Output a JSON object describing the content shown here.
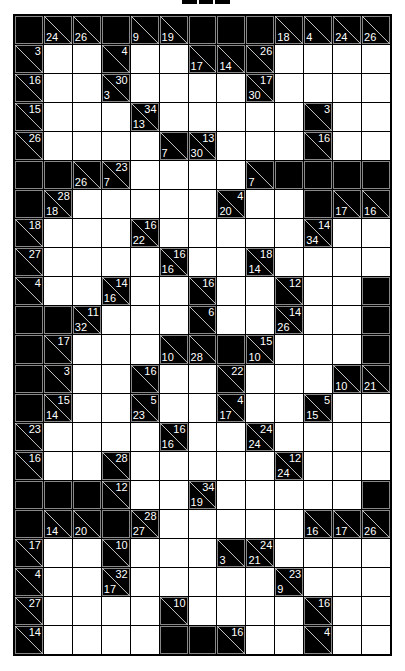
{
  "puzzle": {
    "type": "kakuro",
    "rows": 22,
    "cols": 13,
    "legend": "B = black block; W = white entry cell; [down, across] = clue cell (null = no clue)",
    "grid": [
      [
        "B",
        [
          24,
          null
        ],
        [
          26,
          null
        ],
        "B",
        [
          9,
          null
        ],
        [
          19,
          null
        ],
        "B",
        "B",
        "B",
        [
          18,
          null
        ],
        [
          4,
          null
        ],
        [
          24,
          null
        ],
        [
          26,
          null
        ]
      ],
      [
        [
          null,
          3
        ],
        "W",
        "W",
        [
          null,
          4
        ],
        "W",
        "W",
        [
          17,
          null
        ],
        [
          14,
          null
        ],
        [
          null,
          26
        ],
        "W",
        "W",
        "W",
        "W"
      ],
      [
        [
          null,
          16
        ],
        "W",
        "W",
        [
          3,
          30
        ],
        "W",
        "W",
        "W",
        "W",
        [
          30,
          17
        ],
        "W",
        "W",
        "W",
        "W"
      ],
      [
        [
          null,
          15
        ],
        "W",
        "W",
        "W",
        [
          13,
          34
        ],
        "W",
        "W",
        "W",
        "W",
        "W",
        [
          null,
          3
        ],
        "W",
        "W"
      ],
      [
        [
          null,
          26
        ],
        "W",
        "W",
        "W",
        "W",
        [
          7,
          null
        ],
        [
          30,
          13
        ],
        "W",
        "W",
        "W",
        [
          null,
          16
        ],
        "W",
        "W"
      ],
      [
        "B",
        "B",
        [
          26,
          null
        ],
        [
          7,
          23
        ],
        "W",
        "W",
        "W",
        "W",
        [
          7,
          null
        ],
        "B",
        "B",
        "B",
        "B"
      ],
      [
        "B",
        [
          18,
          28
        ],
        "W",
        "W",
        "W",
        "W",
        "W",
        [
          20,
          4
        ],
        "W",
        "W",
        "B",
        [
          17,
          null
        ],
        [
          16,
          null
        ]
      ],
      [
        [
          null,
          18
        ],
        "W",
        "W",
        "W",
        [
          22,
          16
        ],
        "W",
        "W",
        "W",
        "W",
        "W",
        [
          34,
          14
        ],
        "W",
        "W"
      ],
      [
        [
          null,
          27
        ],
        "W",
        "W",
        "W",
        "W",
        [
          16,
          16
        ],
        "W",
        "W",
        [
          14,
          18
        ],
        "W",
        "W",
        "W",
        "W"
      ],
      [
        [
          null,
          4
        ],
        "W",
        "W",
        [
          16,
          14
        ],
        "W",
        "W",
        [
          null,
          16
        ],
        "W",
        "W",
        [
          null,
          12
        ],
        "W",
        "W",
        "B"
      ],
      [
        "B",
        "B",
        [
          32,
          11
        ],
        "W",
        "W",
        "W",
        [
          null,
          6
        ],
        "W",
        "W",
        [
          26,
          14
        ],
        "W",
        "W",
        "B"
      ],
      [
        "B",
        [
          null,
          17
        ],
        "W",
        "W",
        "W",
        [
          10,
          null
        ],
        [
          28,
          null
        ],
        "B",
        [
          10,
          15
        ],
        "W",
        "W",
        "W",
        "B"
      ],
      [
        "B",
        [
          null,
          3
        ],
        "W",
        "W",
        [
          null,
          16
        ],
        "W",
        "W",
        [
          null,
          22
        ],
        "W",
        "W",
        "W",
        [
          10,
          null
        ],
        [
          21,
          null
        ]
      ],
      [
        "B",
        [
          14,
          15
        ],
        "W",
        "W",
        [
          23,
          5
        ],
        "W",
        "W",
        [
          17,
          4
        ],
        "W",
        "W",
        [
          15,
          5
        ],
        "W",
        "W"
      ],
      [
        [
          null,
          23
        ],
        "W",
        "W",
        "W",
        "W",
        [
          16,
          16
        ],
        "W",
        "W",
        [
          24,
          24
        ],
        "W",
        "W",
        "W",
        "W"
      ],
      [
        [
          null,
          16
        ],
        "W",
        "W",
        [
          null,
          28
        ],
        "W",
        "W",
        "W",
        "W",
        "W",
        [
          24,
          12
        ],
        "W",
        "W",
        "W"
      ],
      [
        "B",
        "B",
        "B",
        [
          null,
          12
        ],
        "W",
        "W",
        [
          19,
          34
        ],
        "W",
        "W",
        "W",
        "W",
        "W",
        "B"
      ],
      [
        "B",
        [
          14,
          null
        ],
        [
          20,
          null
        ],
        "B",
        [
          27,
          28
        ],
        "W",
        "W",
        "W",
        "W",
        "W",
        [
          16,
          null
        ],
        [
          17,
          null
        ],
        [
          26,
          null
        ]
      ],
      [
        [
          null,
          17
        ],
        "W",
        "W",
        [
          null,
          10
        ],
        "W",
        "W",
        "W",
        [
          3,
          null
        ],
        [
          21,
          24
        ],
        "W",
        "W",
        "W",
        "W"
      ],
      [
        [
          null,
          4
        ],
        "W",
        "W",
        [
          17,
          32
        ],
        "W",
        "W",
        "W",
        "W",
        "W",
        [
          9,
          23
        ],
        "W",
        "W",
        "W"
      ],
      [
        [
          null,
          27
        ],
        "W",
        "W",
        "W",
        "W",
        [
          null,
          10
        ],
        "W",
        "W",
        "W",
        "W",
        [
          null,
          16
        ],
        "W",
        "W"
      ],
      [
        [
          null,
          14
        ],
        "W",
        "W",
        "W",
        "W",
        "B",
        "B",
        [
          null,
          16
        ],
        "W",
        "W",
        [
          null,
          4
        ],
        "W",
        "W"
      ]
    ]
  }
}
